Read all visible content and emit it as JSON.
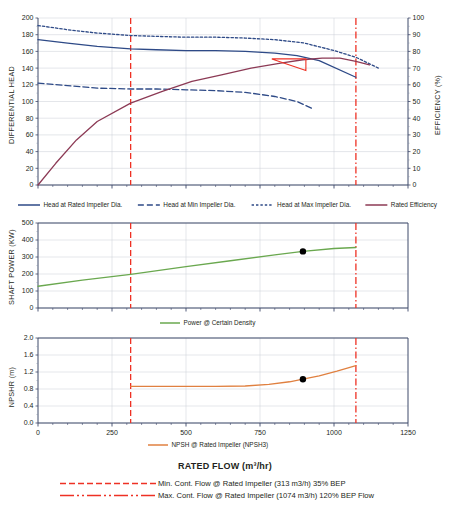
{
  "chart_data": [
    {
      "id": "head-efficiency",
      "type": "line",
      "title": "",
      "xlabel": "RATED FLOW (m³/hr)",
      "ylabel": "DIFFERENTIAL HEAD",
      "y2label": "EFFICIENCY (%)",
      "xlim": [
        0,
        1250
      ],
      "ylim": [
        0,
        200
      ],
      "y2lim": [
        0,
        100
      ],
      "xticks": [
        0,
        250,
        500,
        750,
        1000,
        1250
      ],
      "yticks": [
        0,
        20,
        40,
        60,
        80,
        100,
        120,
        140,
        160,
        180,
        200
      ],
      "y2ticks": [
        0,
        10,
        20,
        30,
        40,
        50,
        60,
        70,
        80,
        90,
        100
      ],
      "grid": true,
      "legend_position": "bottom",
      "series": [
        {
          "name": "Head at Rated Impeller Dia.",
          "color": "#2e4a87",
          "style": "solid",
          "axis": "left",
          "x": [
            0,
            100,
            200,
            313,
            400,
            500,
            600,
            700,
            800,
            875,
            950,
            1074
          ],
          "values": [
            174,
            170,
            166,
            163,
            162,
            161,
            161,
            160,
            158,
            155,
            149,
            129
          ]
        },
        {
          "name": "Head at Min Impeller Dia.",
          "color": "#2e4a87",
          "style": "dashed",
          "axis": "left",
          "x": [
            0,
            100,
            200,
            313,
            400,
            500,
            600,
            700,
            800,
            875,
            930
          ],
          "values": [
            122,
            119,
            116,
            115,
            115,
            114,
            113,
            111,
            106,
            100,
            91
          ]
        },
        {
          "name": "Head at Max Impeller Dia.",
          "color": "#2e4a87",
          "style": "dotted",
          "axis": "left",
          "x": [
            0,
            100,
            200,
            313,
            400,
            500,
            600,
            700,
            800,
            900,
            1000,
            1074,
            1150
          ],
          "values": [
            191,
            186,
            182,
            179,
            178,
            177,
            177,
            176,
            174,
            170,
            161,
            153,
            140
          ]
        },
        {
          "name": "Rated Efficiency",
          "color": "#8c3a55",
          "style": "solid",
          "axis": "right",
          "x": [
            0,
            60,
            130,
            200,
            313,
            420,
            520,
            620,
            720,
            820,
            895,
            960,
            1020,
            1074,
            1120
          ],
          "values": [
            0,
            13,
            27,
            38,
            49,
            56,
            62,
            66,
            70,
            73,
            75,
            76,
            76,
            74,
            72
          ]
        }
      ],
      "markers": [
        {
          "name": "bep-triangle",
          "color": "#ee3124",
          "points": [
            [
              790,
              151
            ],
            [
              905,
              151
            ],
            [
              905,
              137
            ]
          ]
        }
      ]
    },
    {
      "id": "shaft-power",
      "type": "line",
      "title": "",
      "xlabel": "RATED FLOW (m³/hr)",
      "ylabel": "SHAFT POWER (KW)",
      "xlim": [
        0,
        1250
      ],
      "ylim": [
        0,
        500
      ],
      "xticks": [
        0,
        250,
        500,
        750,
        1000,
        1250
      ],
      "yticks": [
        0,
        100,
        200,
        300,
        400,
        500
      ],
      "grid": true,
      "legend_position": "bottom",
      "series": [
        {
          "name": "Power @ Certain Density",
          "color": "#6aa84f",
          "style": "solid",
          "axis": "left",
          "x": [
            0,
            150,
            313,
            500,
            650,
            800,
            895,
            1000,
            1074
          ],
          "values": [
            128,
            164,
            198,
            243,
            278,
            312,
            333,
            350,
            356
          ]
        }
      ],
      "markers": [
        {
          "name": "rated-point",
          "color": "#000000",
          "x": 895,
          "y": 333
        }
      ]
    },
    {
      "id": "npshr",
      "type": "line",
      "title": "",
      "xlabel": "RATED FLOW (m³/hr)",
      "ylabel": "NPSHR (m)",
      "xlim": [
        0,
        1250
      ],
      "ylim": [
        0.0,
        2.0
      ],
      "xticks": [
        0,
        250,
        500,
        750,
        1000,
        1250
      ],
      "yticks": [
        "0.0",
        "0.4",
        "0.8",
        "1.2",
        "1.6",
        "2.0"
      ],
      "grid": true,
      "legend_position": "bottom",
      "series": [
        {
          "name": "NPSH @ Rated Impeller (NPSH3)",
          "color": "#e08040",
          "style": "solid",
          "axis": "left",
          "x": [
            313,
            450,
            600,
            700,
            780,
            850,
            895,
            950,
            1010,
            1074
          ],
          "values": [
            0.86,
            0.86,
            0.86,
            0.87,
            0.91,
            0.97,
            1.03,
            1.11,
            1.22,
            1.35
          ]
        }
      ],
      "markers": [
        {
          "name": "rated-point",
          "color": "#000000",
          "x": 895,
          "y": 1.03
        }
      ]
    }
  ],
  "reference_lines": [
    {
      "key": "min_cont_flow",
      "label": "Min. Cont. Flow @ Rated Impeller (313 m3/h) 35% BEP",
      "value": 313,
      "color": "#ee3124",
      "style": "dashed"
    },
    {
      "key": "max_cont_flow",
      "label": "Max. Cont. Flow @ Rated Impeller (1074 m3/h) 120% BEP Flow",
      "value": 1074,
      "color": "#ee3124",
      "style": "dash-dot"
    }
  ],
  "head_chart": {
    "ylabel": "DIFFERENTIAL HEAD",
    "y2label": "EFFICIENCY (%)",
    "legend": [
      "Head at Rated Impeller Dia.",
      "Head at Min Impeller Dia.",
      "Head at Max Impeller Dia.",
      "Rated Efficiency"
    ]
  },
  "power_chart": {
    "ylabel": "SHAFT POWER (KW)",
    "legend": [
      "Power @ Certain Density"
    ]
  },
  "npsh_chart": {
    "ylabel": "NPSHR (m)",
    "legend": [
      "NPSH @ Rated Impeller (NPSH3)"
    ]
  },
  "footer": {
    "x_axis_title": "RATED FLOW (m³/hr)",
    "min_line_label": "Min. Cont. Flow @ Rated Impeller (313 m3/h) 35% BEP",
    "max_line_label": "Max. Cont. Flow @ Rated Impeller (1074 m3/h) 120% BEP Flow"
  }
}
